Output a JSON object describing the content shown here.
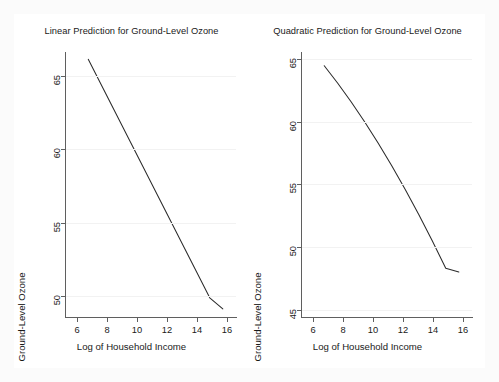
{
  "figure": {
    "width": 499,
    "height": 382,
    "background": "#ffffff",
    "line_color": "#2b2b2b",
    "axis_color": "#5f5f5f",
    "grid_color": "#f2f2f2"
  },
  "chart_data": [
    {
      "type": "line",
      "panel": "left",
      "title": "Linear Prediction for Ground-Level Ozone",
      "xlabel": "Log of Household Income",
      "ylabel": "Ground-Level Ozone",
      "xlim": [
        5.2,
        16.6
      ],
      "ylim": [
        48.6,
        66.6
      ],
      "xticks": [
        6,
        8,
        10,
        12,
        14,
        16
      ],
      "yticks": [
        50,
        55,
        60,
        65
      ],
      "xticklabels": [
        "6",
        "8",
        "10",
        "12",
        "14",
        "16"
      ],
      "yticklabels": [
        "50",
        "55",
        "60",
        "65"
      ],
      "grid": true,
      "legend": null,
      "series": [
        {
          "name": "Linear prediction",
          "x": [
            6.75,
            7.65,
            8.55,
            9.45,
            10.35,
            11.25,
            12.15,
            13.05,
            13.95,
            14.85,
            15.72
          ],
          "y": [
            66.1,
            64.3,
            62.5,
            60.7,
            58.9,
            57.1,
            55.3,
            53.5,
            51.7,
            49.9,
            49.15
          ]
        }
      ]
    },
    {
      "type": "line",
      "panel": "right",
      "title": "Quadratic Prediction for Ground-Level Ozone",
      "xlabel": "Log of Household Income",
      "ylabel": "Ground-Level Ozone",
      "xlim": [
        5.2,
        16.6
      ],
      "ylim": [
        44.4,
        65.6
      ],
      "xticks": [
        6,
        8,
        10,
        12,
        14,
        16
      ],
      "yticks": [
        45,
        50,
        55,
        60,
        65
      ],
      "xticklabels": [
        "6",
        "8",
        "10",
        "12",
        "14",
        "16"
      ],
      "yticklabels": [
        "45",
        "50",
        "55",
        "60",
        "65"
      ],
      "grid": true,
      "legend": null,
      "series": [
        {
          "name": "Quadratic prediction",
          "x": [
            6.75,
            7.65,
            8.55,
            9.45,
            10.35,
            11.25,
            12.15,
            13.05,
            13.95,
            14.85,
            15.72
          ],
          "y": [
            64.5,
            63.1,
            61.6,
            60.0,
            58.3,
            56.5,
            54.6,
            52.6,
            50.5,
            48.3,
            48.0
          ]
        }
      ]
    }
  ],
  "panels": {
    "left": {
      "title": "Linear Prediction for Ground-Level Ozone",
      "xlabel": "Log of Household Income",
      "ylabel": "Ground-Level Ozone",
      "xticklabels": [
        "6",
        "8",
        "10",
        "12",
        "14",
        "16"
      ],
      "yticklabels": [
        "50",
        "55",
        "60",
        "65"
      ]
    },
    "right": {
      "title": "Quadratic Prediction for Ground-Level Ozone",
      "xlabel": "Log of Household Income",
      "ylabel": "Ground-Level Ozone",
      "xticklabels": [
        "6",
        "8",
        "10",
        "12",
        "14",
        "16"
      ],
      "yticklabels": [
        "45",
        "50",
        "55",
        "60",
        "65"
      ]
    }
  }
}
